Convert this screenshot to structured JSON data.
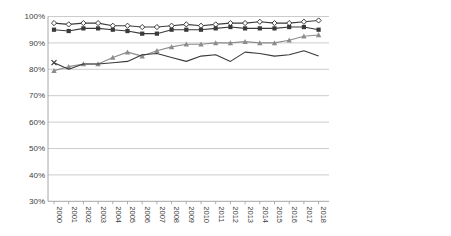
{
  "chart_data": {
    "type": "line",
    "title": "",
    "xlabel": "",
    "ylabel": "",
    "x_labels": [
      "2000",
      "2001",
      "2002",
      "2003",
      "2004",
      "2005",
      "2006",
      "2007",
      "2008",
      "2009",
      "2010",
      "2011",
      "2012",
      "2013",
      "2014",
      "2015",
      "2016",
      "2017",
      "2018"
    ],
    "y_ticks": [
      "100%",
      "90%",
      "80%",
      "70%",
      "60%",
      "50%",
      "40%",
      "30%"
    ],
    "ylim": [
      30,
      100
    ],
    "grid": "horizontal",
    "legend_position": "right",
    "axis_color": "#9c9c9c",
    "gridline_color": "#c6c6c6",
    "text_color": "#404040",
    "series": [
      {
        "name": "Elementary workers",
        "marker": "diamond-open",
        "color": "#3a3a3a",
        "line_width": 1.1,
        "values": [
          97.5,
          97,
          97.5,
          97.5,
          96.5,
          96.5,
          96,
          96,
          96.5,
          97,
          96.5,
          97,
          97.5,
          97.5,
          98,
          97.5,
          97.5,
          98,
          98.5
        ]
      },
      {
        "name": "Operators & assemblers",
        "marker": "square-filled",
        "color": "#3a3a3a",
        "line_width": 1.1,
        "values": [
          95,
          94.5,
          95.5,
          95.5,
          95,
          94.5,
          93.5,
          93.5,
          95,
          95,
          95,
          95.5,
          96,
          95.5,
          95.5,
          95.5,
          96,
          96,
          95
        ]
      },
      {
        "name": "Service workers",
        "marker": "triangle-filled",
        "color": "#8c8c8c",
        "line_width": 1.1,
        "values": [
          79.5,
          81,
          82,
          82,
          84.5,
          86.5,
          85,
          87,
          88.5,
          89.5,
          89.5,
          90,
          90,
          90.5,
          90,
          90,
          91,
          92.5,
          93
        ]
      },
      {
        "name": "Craft workers",
        "marker": "x-cross",
        "color": "#3a3a3a",
        "line_width": 1.1,
        "values": [
          82.5,
          80,
          82,
          82,
          82.5,
          83,
          85.5,
          86,
          84.5,
          83,
          85,
          85.5,
          83,
          86.5,
          86,
          85,
          85.5,
          87,
          85
        ]
      },
      {
        "name": "Clerical workers",
        "marker": "square-open",
        "color": "#9e9e9e",
        "line_width": 1.1,
        "values": [
          60.5,
          62,
          64.5,
          64.5,
          67.5,
          66,
          67.5,
          74.5,
          75,
          75,
          76,
          76.5,
          77,
          78,
          79,
          80,
          81.5,
          83,
          84.5
        ]
      },
      {
        "name": "Technicians & associate professionals",
        "marker": "plus",
        "color": "#3a3a3a",
        "line_width": 1.1,
        "values": [
          63.5,
          64.5,
          65.5,
          65,
          63.5,
          66.5,
          69,
          63.5,
          71.5,
          71.5,
          68,
          71.5,
          73,
          74.5,
          74,
          74.5,
          75.5,
          77,
          78.5
        ]
      },
      {
        "name": "Professionals",
        "marker": "square-small-filled",
        "color": "#262626",
        "line_width": 2,
        "values": [
          50,
          48.5,
          46,
          44.5,
          52,
          60,
          57.5,
          64,
          57.5,
          56,
          59,
          56.5,
          60,
          63.5,
          65,
          61.5,
          64.5,
          67,
          68.5
        ]
      },
      {
        "name": "Managers",
        "marker": "circle-open",
        "color": "#6e6e6e",
        "line_width": 1.1,
        "values": [
          37,
          35,
          40.5,
          38.5,
          37.5,
          39.5,
          42.5,
          53,
          45.5,
          46.5,
          46,
          48,
          53.5,
          53.5,
          52.5,
          51.5,
          55.5,
          55.5,
          59.5
        ]
      }
    ]
  }
}
